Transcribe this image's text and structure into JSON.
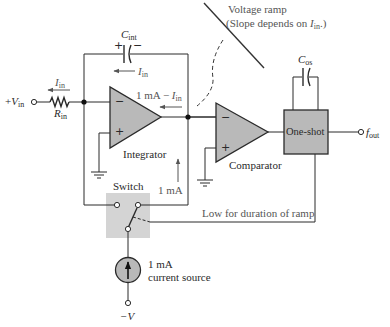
{
  "diagram": {
    "colors": {
      "wire": "#2a2a2a",
      "block_fill": "#b9b9b9",
      "switch_fill": "#d4d4d4",
      "text": "#2a2a2a",
      "annotation": "#555555"
    },
    "input": {
      "terminal_prefix": "+",
      "terminal_var": "V",
      "terminal_sub": "in",
      "resistor_var": "R",
      "resistor_sub": "in",
      "current_var": "I",
      "current_sub": "in"
    },
    "integrator_cap": {
      "var": "C",
      "sub": "int",
      "plus": "+",
      "minus": "−"
    },
    "feedback_current": {
      "var": "I",
      "sub": "in"
    },
    "difference_current": {
      "prefix": "1 mA  − ",
      "var": "I",
      "sub": "in"
    },
    "integrator": {
      "label": "Integrator",
      "minus": "−",
      "plus": "+"
    },
    "comparator": {
      "label": "Comparator",
      "minus": "−",
      "plus": "+"
    },
    "ramp_annotation": {
      "line1": "Voltage ramp",
      "line2_prefix": "(Slope depends on ",
      "line2_var": "I",
      "line2_sub": "in",
      "line2_suffix": ".)"
    },
    "one_shot": {
      "label": "One-shot",
      "cap_var": "C",
      "cap_sub": "os",
      "output_var": "f",
      "output_sub": "out"
    },
    "switch": {
      "label": "Switch",
      "current_label": "1 mA"
    },
    "control_annotation": {
      "label": "Low for duration of ramp"
    },
    "current_source": {
      "line1": "1 mA",
      "line2": "current source",
      "supply": "−V"
    }
  }
}
